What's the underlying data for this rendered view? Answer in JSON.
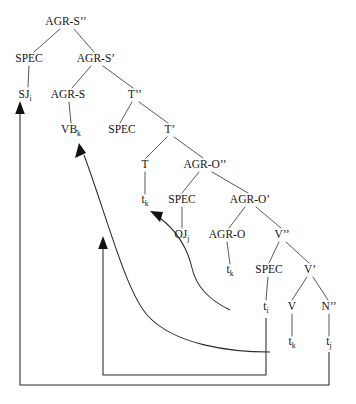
{
  "figure": {
    "type": "syntax-tree",
    "title": "",
    "canvas": {
      "width": 356,
      "height": 404,
      "background": "#ffffff"
    },
    "colors": {
      "text": "#151515",
      "branch": "#3a3a3a",
      "movement_arrow": "#2b2b2b",
      "arrowhead": "#111111"
    }
  },
  "nodes": [
    {
      "id": "agrs2",
      "label": "AGR-S",
      "sup": "’’",
      "sub": "",
      "x": 66,
      "y": 25
    },
    {
      "id": "spec1",
      "label": "SPEC",
      "sup": "",
      "sub": "",
      "x": 29,
      "y": 62
    },
    {
      "id": "agrs1",
      "label": "AGR-S",
      "sup": "’",
      "sub": "",
      "x": 96,
      "y": 62
    },
    {
      "id": "sj",
      "label": "SJ",
      "sup": "",
      "sub": "i",
      "x": 25,
      "y": 98
    },
    {
      "id": "agrs0",
      "label": "AGR-S",
      "sup": "",
      "sub": "",
      "x": 68,
      "y": 98
    },
    {
      "id": "t2",
      "label": "T",
      "sup": "’’",
      "sub": "",
      "x": 135,
      "y": 98
    },
    {
      "id": "vb",
      "label": "VB",
      "sup": "",
      "sub": "k",
      "x": 71,
      "y": 133
    },
    {
      "id": "spec2",
      "label": "SPEC",
      "sup": "",
      "sub": "",
      "x": 122,
      "y": 133
    },
    {
      "id": "t1",
      "label": "T",
      "sup": "’",
      "sub": "",
      "x": 170,
      "y": 133
    },
    {
      "id": "t0",
      "label": "T",
      "sup": "",
      "sub": "",
      "x": 145,
      "y": 168
    },
    {
      "id": "agro2",
      "label": "AGR-O",
      "sup": "’’",
      "sub": "",
      "x": 205,
      "y": 168
    },
    {
      "id": "tk1",
      "label": "t",
      "sup": "",
      "sub": "k",
      "x": 145,
      "y": 203
    },
    {
      "id": "spec3",
      "label": "SPEC",
      "sup": "",
      "sub": "",
      "x": 182,
      "y": 203
    },
    {
      "id": "agro1",
      "label": "AGR-O",
      "sup": "’",
      "sub": "",
      "x": 250,
      "y": 203
    },
    {
      "id": "oj",
      "label": "OJ",
      "sup": "",
      "sub": "j",
      "x": 182,
      "y": 238
    },
    {
      "id": "agro0",
      "label": "AGR-O",
      "sup": "",
      "sub": "",
      "x": 227,
      "y": 238
    },
    {
      "id": "v2",
      "label": "V",
      "sup": "’’",
      "sub": "",
      "x": 282,
      "y": 238
    },
    {
      "id": "tk2",
      "label": "t",
      "sup": "",
      "sub": "k",
      "x": 230,
      "y": 273
    },
    {
      "id": "spec4",
      "label": "SPEC",
      "sup": "",
      "sub": "",
      "x": 269,
      "y": 273
    },
    {
      "id": "v1",
      "label": "V",
      "sup": "’",
      "sub": "",
      "x": 310,
      "y": 273
    },
    {
      "id": "ti1",
      "label": "t",
      "sup": "",
      "sub": "i",
      "x": 266,
      "y": 310
    },
    {
      "id": "v0",
      "label": "V",
      "sup": "",
      "sub": "",
      "x": 292,
      "y": 310
    },
    {
      "id": "n2",
      "label": "N",
      "sup": "’’",
      "sub": "",
      "x": 329,
      "y": 310
    },
    {
      "id": "tk3",
      "label": "t",
      "sup": "",
      "sub": "k",
      "x": 292,
      "y": 345
    },
    {
      "id": "tj1",
      "label": "t",
      "sup": "",
      "sub": "j",
      "x": 329,
      "y": 345
    }
  ],
  "branches": [
    {
      "from": "agrs2",
      "to": "spec1"
    },
    {
      "from": "agrs2",
      "to": "agrs1"
    },
    {
      "from": "spec1",
      "to": "sj"
    },
    {
      "from": "agrs1",
      "to": "agrs0"
    },
    {
      "from": "agrs1",
      "to": "t2"
    },
    {
      "from": "agrs0",
      "to": "vb"
    },
    {
      "from": "t2",
      "to": "spec2"
    },
    {
      "from": "t2",
      "to": "t1"
    },
    {
      "from": "t1",
      "to": "t0"
    },
    {
      "from": "t1",
      "to": "agro2"
    },
    {
      "from": "t0",
      "to": "tk1"
    },
    {
      "from": "agro2",
      "to": "spec3"
    },
    {
      "from": "agro2",
      "to": "agro1"
    },
    {
      "from": "spec3",
      "to": "oj"
    },
    {
      "from": "agro1",
      "to": "agro0"
    },
    {
      "from": "agro1",
      "to": "v2"
    },
    {
      "from": "agro0",
      "to": "tk2"
    },
    {
      "from": "v2",
      "to": "spec4"
    },
    {
      "from": "v2",
      "to": "v1"
    },
    {
      "from": "spec4",
      "to": "ti1"
    },
    {
      "from": "v1",
      "to": "v0"
    },
    {
      "from": "v1",
      "to": "n2"
    },
    {
      "from": "v0",
      "to": "tk3"
    },
    {
      "from": "n2",
      "to": "tj1"
    }
  ],
  "movements": [
    {
      "id": "mv-tj-to-sj",
      "from_node": "tj1",
      "to_node": "sj",
      "index": "i",
      "description": "N'' trace t-j raises to SPEC of AGR-S'' (subject SJ-i)"
    },
    {
      "id": "mv-tk-to-vb",
      "from_node": "tk2",
      "to_node": "vb",
      "index": "k",
      "description": "V head trace t-k raises to AGR-S (VB-k)"
    },
    {
      "id": "mv-tk-to-t",
      "from_node": "tk2",
      "to_node": "tk1",
      "index": "k",
      "description": "head trace chain through T"
    },
    {
      "id": "mv-ti-to-oj",
      "from_node": "ti1",
      "to_node": "oj",
      "index": "j",
      "description": "object trace raises to SPEC of AGR-O'' (OJ-j)"
    }
  ],
  "legend": {
    "visible": false,
    "entries": []
  }
}
